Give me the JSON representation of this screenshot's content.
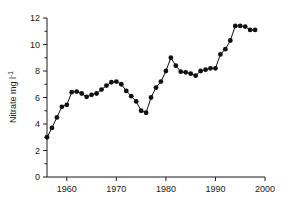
{
  "chart_data": {
    "type": "line",
    "title": "",
    "subtitle": "",
    "xlabel": "",
    "ylabel": "Nitrate mg l⁻¹",
    "ylabel_parts": {
      "text": "Nitrate mg l",
      "superscript": "-1"
    },
    "xlim": [
      1956,
      2000
    ],
    "ylim": [
      0,
      12
    ],
    "xticks": [
      1960,
      1970,
      1980,
      1990,
      2000
    ],
    "xtick_labels": [
      "1960",
      "1970",
      "1980",
      "1990",
      "2000"
    ],
    "yticks": [
      0,
      2,
      4,
      6,
      8,
      10,
      12
    ],
    "ytick_labels": [
      "0",
      "2",
      "4",
      "6",
      "8",
      "10",
      "12"
    ],
    "yminorticks": [
      1,
      3,
      5,
      7,
      9,
      11
    ],
    "grid": false,
    "legend": null,
    "marker": "filled-circle",
    "line_color": "#111111",
    "marker_color": "#111111",
    "axis_color": "#1a1a1a",
    "background_color": "#ffffff",
    "series": [
      {
        "name": "Nitrate concentration",
        "x": [
          1956,
          1957,
          1958,
          1959,
          1960,
          1961,
          1962,
          1963,
          1964,
          1965,
          1966,
          1967,
          1968,
          1969,
          1970,
          1971,
          1972,
          1973,
          1974,
          1975,
          1976,
          1977,
          1978,
          1979,
          1980,
          1981,
          1982,
          1983,
          1984,
          1985,
          1986,
          1987,
          1988,
          1989,
          1990,
          1991,
          1992,
          1993,
          1994,
          1995,
          1996,
          1997,
          1998
        ],
        "y": [
          3.0,
          3.7,
          4.5,
          5.3,
          5.45,
          6.4,
          6.45,
          6.3,
          6.05,
          6.2,
          6.3,
          6.6,
          6.9,
          7.15,
          7.2,
          7.0,
          6.5,
          6.1,
          5.7,
          5.0,
          4.85,
          6.0,
          6.75,
          7.2,
          8.0,
          9.0,
          8.4,
          7.95,
          7.9,
          7.8,
          7.65,
          8.0,
          8.1,
          8.2,
          8.2,
          9.25,
          9.65,
          10.3,
          11.4,
          11.4,
          11.35,
          11.1,
          11.1
        ]
      }
    ]
  }
}
